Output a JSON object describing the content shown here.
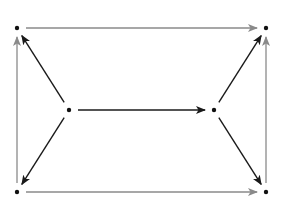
{
  "diagram": {
    "type": "directed-graph",
    "nodes": [
      {
        "id": "top-left"
      },
      {
        "id": "top-right"
      },
      {
        "id": "mid-left"
      },
      {
        "id": "mid-right"
      },
      {
        "id": "bottom-left"
      },
      {
        "id": "bottom-right"
      }
    ],
    "edges": [
      {
        "from": "top-left",
        "to": "top-right",
        "style": "gray"
      },
      {
        "from": "bottom-left",
        "to": "bottom-right",
        "style": "gray"
      },
      {
        "from": "bottom-left",
        "to": "top-left",
        "style": "gray"
      },
      {
        "from": "bottom-right",
        "to": "top-right",
        "style": "gray"
      },
      {
        "from": "mid-left",
        "to": "mid-right",
        "style": "black"
      },
      {
        "from": "mid-left",
        "to": "top-left",
        "style": "black"
      },
      {
        "from": "mid-left",
        "to": "bottom-left",
        "style": "black"
      },
      {
        "from": "mid-right",
        "to": "top-right",
        "style": "black"
      },
      {
        "from": "mid-right",
        "to": "bottom-right",
        "style": "black"
      }
    ],
    "colors": {
      "gray": "#8a8a8a",
      "black": "#1a1a1a",
      "node": "#111111"
    }
  }
}
